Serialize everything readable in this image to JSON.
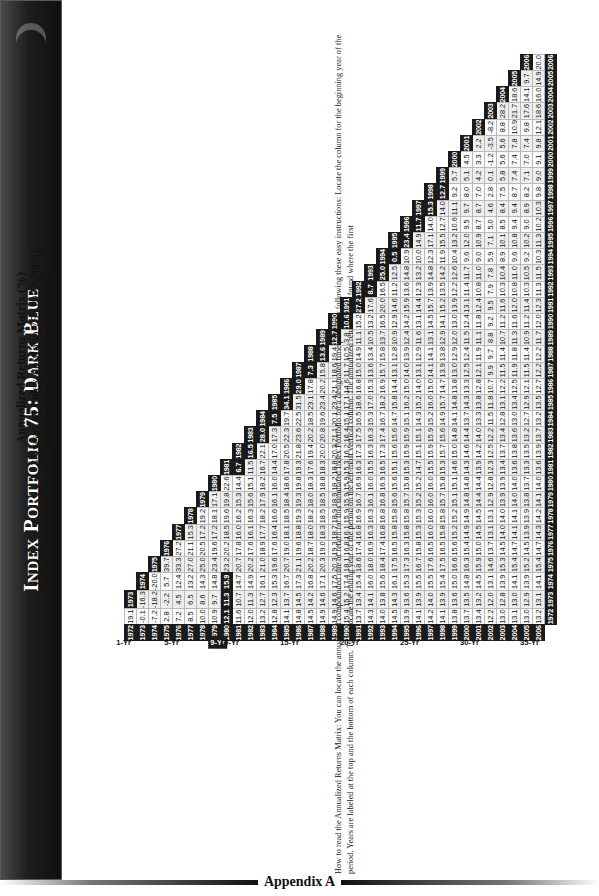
{
  "banner": {
    "title": "Index Portfolio 75: Dark Blue",
    "moon_icon": "crescent-moon-icon"
  },
  "subtitle": {
    "line1": "Annualized Returns Matrix (%)",
    "line2": "35 years of Index Portfolio 75 (1972-2006)",
    "line3": "Returns Net of IFA and DFA Fees"
  },
  "footer": {
    "appendix_label": "Appendix A",
    "note": "How to read the Annualized Returns Matrix: You can locate the annualized compounded rate of return for this simulated Index Portfolio for a designated time period by following these easy instructions: Locate the column for the beginning year of the period. Years are labeled at the top and the bottom of each column. Then, locate the ending year of the period on the left-most vertical column. The annualized return can be found where the first"
  },
  "chart_data": {
    "type": "table",
    "title": "Annualized Returns Matrix (%)",
    "subtitle": "35 years of Index Portfolio 75 (1972-2006) — Returns Net of IFA and DFA Fees",
    "columns": [
      1972,
      1973,
      1974,
      1975,
      1976,
      1977,
      1978,
      1979,
      1980,
      1981,
      1982,
      1983,
      1984,
      1985,
      1986,
      1987,
      1988,
      1989,
      1990,
      1991,
      1992,
      1993,
      1994,
      1995,
      1996,
      1997,
      1998,
      1999,
      2000,
      2001,
      2002,
      2003,
      2004,
      2005,
      2006
    ],
    "row_years": [
      1972,
      1973,
      1974,
      1975,
      1976,
      1977,
      1978,
      1979,
      1980,
      1981,
      1982,
      1983,
      1984,
      1985,
      1986,
      1987,
      1988,
      1989,
      1990,
      1991,
      1992,
      1993,
      1994,
      1995,
      1996,
      1997,
      1998,
      1999,
      2000,
      2001,
      2002,
      2003,
      2004,
      2005,
      2006
    ],
    "period_labels": [
      {
        "row": 1972,
        "label": "1-Yr",
        "highlight": false
      },
      {
        "row": 1976,
        "label": "5-Yr",
        "highlight": false
      },
      {
        "row": 1980,
        "label": "9-Yr",
        "highlight": true
      },
      {
        "row": 1981,
        "label": "10-Yr",
        "highlight": false
      },
      {
        "row": 1986,
        "label": "15-Yr",
        "highlight": false
      },
      {
        "row": 1991,
        "label": "20-Yr",
        "highlight": false
      },
      {
        "row": 1996,
        "label": "25-Yr",
        "highlight": false
      },
      {
        "row": 2001,
        "label": "30-Yr",
        "highlight": false
      },
      {
        "row": 2006,
        "label": "35-Yr",
        "highlight": false
      }
    ],
    "highlighted_cells": [
      {
        "row": 1980,
        "col": 1972
      },
      {
        "row": 1980,
        "col": 1973
      },
      {
        "row": 1980,
        "col": 1974
      },
      {
        "row": 1981,
        "col": 1981
      },
      {
        "row": 1982,
        "col": 1982
      },
      {
        "row": 1983,
        "col": 1983
      },
      {
        "row": 1984,
        "col": 1984
      },
      {
        "row": 1985,
        "col": 1985
      },
      {
        "row": 1986,
        "col": 1986
      },
      {
        "row": 1987,
        "col": 1987
      },
      {
        "row": 1988,
        "col": 1988
      },
      {
        "row": 1989,
        "col": 1989
      },
      {
        "row": 1990,
        "col": 1990
      },
      {
        "row": 1991,
        "col": 1991
      },
      {
        "row": 1992,
        "col": 1992
      },
      {
        "row": 1993,
        "col": 1993
      },
      {
        "row": 1994,
        "col": 1994
      },
      {
        "row": 1995,
        "col": 1995
      },
      {
        "row": 1996,
        "col": 1996
      },
      {
        "row": 1997,
        "col": 1997
      },
      {
        "row": 1998,
        "col": 1998
      }
    ],
    "rows": [
      {
        "year": 1972,
        "values": [
          19.1
        ]
      },
      {
        "year": 1973,
        "values": [
          -0.1,
          -16.3
        ]
      },
      {
        "year": 1974,
        "values": [
          -7.2,
          -18.2,
          -20.0
        ]
      },
      {
        "year": 1975,
        "values": [
          2.8,
          -2.2,
          5.7,
          39.7
        ]
      },
      {
        "year": 1976,
        "values": [
          7.2,
          4.5,
          12.4,
          33.3,
          27.2
        ]
      },
      {
        "year": 1977,
        "values": [
          8.5,
          6.5,
          13.2,
          27.0,
          21.1,
          15.3
        ]
      },
      {
        "year": 1978,
        "values": [
          10.0,
          8.6,
          14.3,
          25.0,
          20.5,
          17.2,
          19.2
        ]
      },
      {
        "year": 1979,
        "values": [
          10.9,
          9.7,
          14.8,
          23.4,
          19.6,
          17.2,
          18.1,
          17.1
        ]
      },
      {
        "year": 1980,
        "values": [
          12.1,
          11.3,
          15.9,
          23.2,
          20.2,
          18.5,
          19.6,
          19.8,
          22.6
        ]
      },
      {
        "year": 1981,
        "values": [
          11.6,
          10.7,
          14.7,
          20.7,
          17.8,
          16.0,
          16.2,
          15.3,
          14.4,
          6.7
        ]
      },
      {
        "year": 1982,
        "values": [
          12.0,
          11.3,
          14.9,
          20.2,
          17.6,
          16.1,
          16.3,
          15.6,
          15.1,
          11.5,
          16.5
        ]
      },
      {
        "year": 1983,
        "values": [
          13.2,
          12.7,
          16.1,
          21.0,
          18.9,
          17.7,
          18.2,
          17.9,
          18.2,
          16.7,
          22.1,
          28.0
        ]
      },
      {
        "year": 1984,
        "values": [
          12.8,
          12.3,
          15.3,
          19.6,
          17.6,
          16.4,
          16.6,
          16.1,
          16.0,
          14.4,
          17.0,
          17.3,
          7.5
        ]
      },
      {
        "year": 1985,
        "values": [
          14.1,
          13.7,
          16.7,
          20.7,
          19.0,
          18.1,
          18.5,
          18.4,
          18.6,
          17.8,
          20.5,
          22.3,
          19.7,
          34.1
        ]
      },
      {
        "year": 1986,
        "values": [
          14.8,
          14.5,
          17.3,
          21.1,
          19.6,
          18.8,
          19.3,
          19.3,
          19.8,
          19.3,
          21.8,
          23.6,
          22.5,
          31.5,
          29.0
        ]
      },
      {
        "year": 1987,
        "values": [
          14.5,
          14.2,
          16.8,
          20.2,
          18.7,
          18.0,
          18.2,
          18.0,
          18.3,
          17.6,
          19.4,
          20.2,
          18.5,
          23.1,
          17.8,
          7.3
        ]
      },
      {
        "year": 1988,
        "values": [
          14.9,
          14.6,
          17.1,
          20.3,
          19.0,
          18.3,
          18.5,
          18.5,
          18.8,
          18.3,
          20.0,
          20.8,
          19.6,
          23.4,
          20.2,
          15.8,
          13.6
        ]
      },
      {
        "year": 1989,
        "values": [
          14.9,
          14.6,
          17.5,
          20.3,
          19.3,
          18.7,
          18.9,
          18.9,
          19.2,
          18.8,
          20.3,
          21.1,
          20.1,
          23.4,
          21.1,
          18.6,
          19.4,
          12.7
        ]
      },
      {
        "year": 1990,
        "values": [
          15.4,
          15.2,
          17.4,
          18.1,
          16.8,
          16.1,
          15.9,
          15.9,
          15.9,
          15.3,
          16.2,
          16.4,
          15.1,
          17.1,
          14.6,
          11.7,
          10.5,
          3.8,
          10.6
        ]
      },
      {
        "year": 1991,
        "values": [
          13.7,
          13.4,
          15.4,
          18.6,
          17.4,
          16.8,
          16.9,
          16.7,
          16.9,
          16.3,
          17.3,
          17.5,
          16.5,
          18.6,
          16.8,
          15.0,
          14.9,
          11.1,
          15.2,
          27.2
        ]
      },
      {
        "year": 1992,
        "values": [
          14.3,
          14.1,
          16.0,
          18.0,
          16.9,
          16.3,
          16.3,
          16.1,
          16.0,
          15.5,
          16.3,
          16.3,
          15.3,
          17.0,
          15.3,
          13.6,
          13.4,
          10.5,
          13.2,
          17.6,
          8.7
        ]
      },
      {
        "year": 1993,
        "values": [
          14.0,
          13.8,
          15.6,
          18.4,
          17.4,
          16.8,
          16.8,
          16.8,
          16.9,
          16.5,
          17.3,
          17.4,
          16.7,
          18.2,
          16.9,
          15.7,
          15.8,
          13.7,
          16.5,
          20.0,
          16.5,
          25.0
        ]
      },
      {
        "year": 1994,
        "values": [
          14.5,
          14.3,
          16.1,
          17.5,
          16.5,
          15.8,
          15.8,
          15.6,
          15.6,
          15.1,
          15.6,
          15.6,
          14.7,
          15.8,
          14.4,
          13.1,
          12.8,
          10.9,
          12.9,
          14.6,
          11.2,
          12.5,
          0.5
        ]
      },
      {
        "year": 1995,
        "values": [
          13.9,
          13.6,
          15.3,
          17.3,
          16.3,
          15.8,
          15.8,
          15.7,
          15.8,
          15.3,
          15.9,
          15.9,
          15.1,
          16.2,
          15.0,
          14.0,
          13.9,
          12.4,
          14.2,
          15.9,
          13.6,
          14.8,
          10.9,
          23.4
        ]
      },
      {
        "year": 1996,
        "values": [
          14.1,
          13.9,
          15.5,
          16.7,
          15.8,
          15.3,
          15.3,
          15.2,
          15.2,
          14.7,
          15.1,
          15.1,
          14.3,
          15.2,
          14.0,
          13.1,
          12.9,
          11.6,
          13.1,
          14.4,
          12.3,
          13.2,
          10.0,
          14.9,
          11.7
        ]
      },
      {
        "year": 1997,
        "values": [
          14.2,
          14.0,
          15.5,
          17.6,
          16.5,
          16.0,
          16.0,
          16.0,
          16.0,
          15.5,
          15.9,
          15.9,
          15.2,
          16.0,
          15.0,
          14.1,
          14.1,
          13.1,
          14.5,
          15.7,
          13.9,
          14.8,
          12.3,
          17.1,
          14.0,
          15.3
        ]
      },
      {
        "year": 1998,
        "values": [
          14.1,
          13.9,
          15.4,
          17.5,
          16.5,
          15.8,
          15.8,
          15.7,
          15.8,
          15.3,
          15.7,
          15.6,
          14.9,
          15.7,
          14.7,
          13.9,
          13.8,
          12.9,
          14.1,
          15.2,
          13.5,
          14.2,
          11.9,
          15.5,
          12.7,
          14.0,
          12.7
        ]
      },
      {
        "year": 1999,
        "values": [
          13.8,
          13.6,
          15.0,
          16.6,
          15.6,
          15.2,
          15.2,
          15.1,
          15.1,
          14.6,
          15.0,
          14.8,
          14.1,
          14.8,
          13.8,
          13.0,
          12.9,
          12.0,
          13.0,
          13.9,
          12.2,
          12.6,
          10.4,
          13.2,
          10.6,
          11.1,
          9.2,
          5.7
        ]
      },
      {
        "year": 2000,
        "values": [
          13.7,
          13.5,
          14.8,
          16.3,
          15.4,
          14.9,
          14.9,
          14.8,
          14.8,
          14.3,
          14.6,
          14.4,
          13.7,
          14.3,
          13.3,
          12.5,
          12.4,
          11.5,
          12.4,
          13.1,
          11.4,
          11.7,
          9.6,
          12.0,
          9.5,
          9.7,
          8.0,
          5.1,
          4.5
        ]
      },
      {
        "year": 2001,
        "values": [
          13.4,
          13.2,
          14.5,
          15.9,
          15.0,
          14.5,
          14.5,
          14.4,
          14.4,
          13.9,
          14.2,
          14.0,
          13.3,
          13.8,
          12.8,
          12.1,
          11.9,
          11.1,
          11.8,
          12.4,
          10.8,
          11.0,
          9.0,
          10.9,
          8.7,
          8.7,
          7.0,
          4.2,
          3.3,
          2.2
        ]
      },
      {
        "year": 2002,
        "values": [
          12.2,
          12.0,
          13.1,
          14.6,
          13.7,
          13.1,
          13.1,
          12.9,
          12.8,
          12.3,
          12.5,
          12.2,
          11.5,
          11.8,
          10.7,
          9.9,
          9.7,
          8.8,
          9.2,
          9.5,
          7.9,
          7.8,
          5.9,
          7.1,
          5.0,
          4.6,
          2.8,
          0.1,
          -1.2,
          -3.5,
          -8.2
        ]
      },
      {
        "year": 2003,
        "values": [
          13.0,
          12.8,
          13.9,
          15.3,
          14.5,
          14.0,
          14.0,
          13.9,
          13.9,
          13.4,
          13.7,
          13.4,
          12.8,
          13.1,
          12.2,
          11.5,
          11.4,
          10.7,
          11.2,
          11.6,
          10.3,
          10.4,
          8.9,
          10.1,
          8.5,
          8.4,
          7.5,
          5.8,
          5.6,
          5.6,
          8.8,
          28.2
        ]
      },
      {
        "year": 2004,
        "values": [
          13.1,
          13.0,
          14.1,
          15.4,
          14.7,
          14.1,
          14.1,
          14.0,
          14.0,
          13.6,
          13.8,
          13.6,
          13.0,
          13.4,
          12.5,
          11.9,
          11.8,
          11.3,
          11.6,
          12.0,
          10.8,
          11.0,
          9.6,
          10.8,
          9.4,
          9.4,
          8.7,
          7.4,
          7.4,
          7.8,
          10.9,
          21.7,
          18.6
        ]
      },
      {
        "year": 2005,
        "values": [
          13.0,
          12.9,
          13.9,
          15.2,
          14.5,
          13.9,
          13.9,
          13.8,
          13.7,
          13.3,
          13.5,
          13.2,
          12.7,
          12.9,
          12.1,
          11.5,
          11.4,
          10.9,
          11.2,
          11.4,
          10.3,
          10.5,
          9.2,
          10.2,
          9.0,
          8.9,
          8.2,
          7.1,
          7.0,
          7.4,
          9.8,
          17.6,
          14.1,
          9.7
        ]
      },
      {
        "year": 2006,
        "values": [
          13.2,
          13.1,
          14.1,
          15.4,
          14.7,
          14.3,
          14.2,
          14.1,
          14.0,
          13.6,
          13.9,
          13.7,
          13.2,
          13.5,
          12.7,
          12.2,
          12.2,
          11.7,
          12.0,
          12.3,
          11.3,
          11.5,
          10.3,
          11.3,
          10.2,
          10.3,
          9.8,
          9.0,
          9.1,
          9.8,
          12.1,
          18.6,
          16.0,
          14.9,
          20.0
        ]
      }
    ]
  }
}
